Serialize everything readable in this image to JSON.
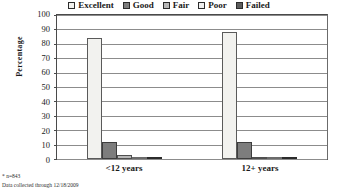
{
  "chart_data": {
    "type": "bar",
    "title": "",
    "xlabel": "",
    "ylabel": "Percentage",
    "categories": [
      "<12 years",
      "12+ years"
    ],
    "ylim": [
      0,
      100
    ],
    "yticks": [
      0,
      10,
      20,
      30,
      40,
      50,
      60,
      70,
      80,
      90,
      100
    ],
    "grid": true,
    "legend_position": "top-center",
    "series": [
      {
        "name": "Excellent",
        "values": [
          84.0,
          88.5
        ],
        "color": "#f2f2ef"
      },
      {
        "name": "Good",
        "values": [
          11.5,
          11.5
        ],
        "color": "#7d7d7d"
      },
      {
        "name": "Fair",
        "values": [
          3.0,
          0.7
        ],
        "color": "#b8b8b8"
      },
      {
        "name": "Poor",
        "values": [
          1.0,
          0.4
        ],
        "color": "#efefef"
      },
      {
        "name": "Failed",
        "values": [
          0.9,
          0.9
        ],
        "color": "#5c5c5c"
      }
    ]
  },
  "footnotes": [
    "* n=843",
    "Data collected through 12/18/2009"
  ]
}
